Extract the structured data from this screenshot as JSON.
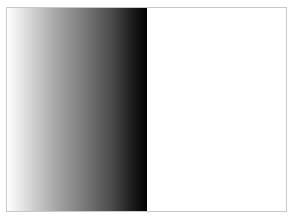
{
  "figure": {
    "frame": {
      "border_color": "#c8c8c8",
      "background": "#ffffff"
    },
    "gradient_panel": {
      "direction": "to right",
      "stops": [
        {
          "color": "#ffffff",
          "pos": "0%"
        },
        {
          "color": "#d9d9d9",
          "pos": "15%"
        },
        {
          "color": "#a6a6a6",
          "pos": "35%"
        },
        {
          "color": "#7a7a7a",
          "pos": "55%"
        },
        {
          "color": "#4a4a4a",
          "pos": "75%"
        },
        {
          "color": "#1a1a1a",
          "pos": "90%"
        },
        {
          "color": "#000000",
          "pos": "100%"
        }
      ]
    },
    "blank_panel": {
      "color": "#ffffff"
    }
  }
}
